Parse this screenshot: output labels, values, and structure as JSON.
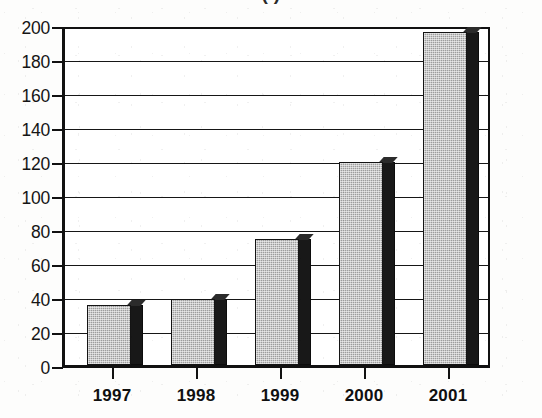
{
  "figure": {
    "title_partial": "(   )",
    "title_note": "title cropped at top edge; only bottom of parentheses visible"
  },
  "axes": {
    "y_ticks": [
      "0",
      "20",
      "40",
      "60",
      "80",
      "100",
      "120",
      "140",
      "160",
      "180",
      "200"
    ],
    "x_ticks": [
      "1997",
      "1998",
      "1999",
      "2000",
      "2001"
    ]
  },
  "style": {
    "bar_fill": "#9d9d9d",
    "bar_shadow": "#181818",
    "axis_color": "#111111",
    "background": "#ffffff"
  },
  "chart_data": {
    "type": "bar",
    "title": "(   )",
    "xlabel": "",
    "ylabel": "",
    "categories": [
      "1997",
      "1998",
      "1999",
      "2000",
      "2001"
    ],
    "values": [
      36,
      39,
      75,
      121,
      198
    ],
    "ylim": [
      0,
      200
    ],
    "ytick_step": 20,
    "grid": true,
    "legend": "none",
    "series": [
      {
        "name": "value",
        "values": [
          36,
          39,
          75,
          121,
          198
        ]
      }
    ]
  }
}
